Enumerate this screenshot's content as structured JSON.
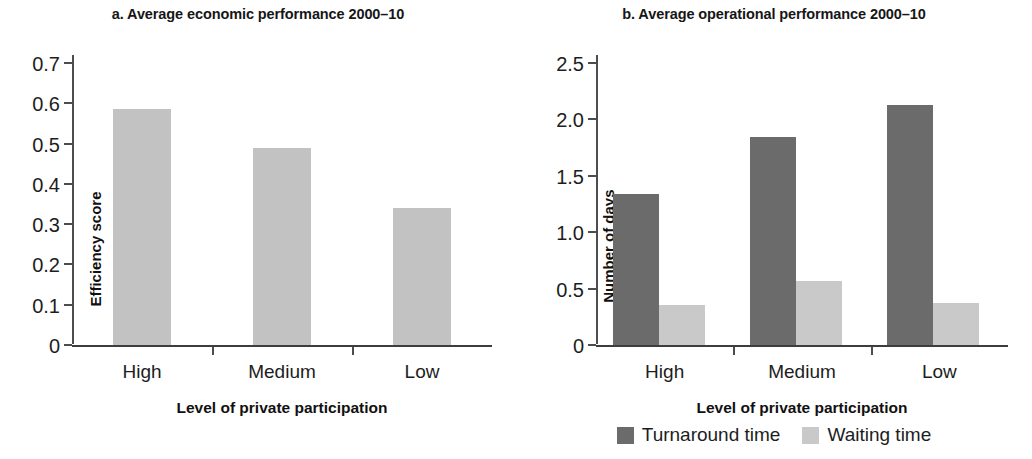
{
  "figure": {
    "panels": [
      {
        "id": "panel-a",
        "title": "a. Average economic performance 2000–10"
      },
      {
        "id": "panel-b",
        "title": "b. Average operational performance 2000–10"
      }
    ]
  },
  "legend": {
    "items": [
      {
        "label": "Turnaround time",
        "color": "#6b6b6b"
      },
      {
        "label": "Waiting time",
        "color": "#c9c9c9"
      }
    ]
  },
  "chart_data": [
    {
      "type": "bar",
      "title": "a. Average economic performance 2000–10",
      "xlabel": "Level of private participation",
      "ylabel": "Efficiency score",
      "categories": [
        "High",
        "Medium",
        "Low"
      ],
      "values": [
        0.585,
        0.49,
        0.34
      ],
      "ylim": [
        0,
        0.7
      ],
      "yticks": [
        0,
        0.1,
        0.2,
        0.3,
        0.4,
        0.5,
        0.6,
        0.7
      ],
      "ytick_labels": [
        "0",
        "0.1",
        "0.2",
        "0.3",
        "0.4",
        "0.5",
        "0.6",
        "0.7"
      ],
      "grid": false,
      "legend": "none",
      "bar_color": "#c2c2c2"
    },
    {
      "type": "bar",
      "title": "b. Average operational performance 2000–10",
      "xlabel": "Level of private participation",
      "ylabel": "Number of days",
      "categories": [
        "High",
        "Medium",
        "Low"
      ],
      "series": [
        {
          "name": "Turnaround time",
          "values": [
            1.34,
            1.845,
            2.13
          ],
          "color": "#6b6b6b"
        },
        {
          "name": "Waiting time",
          "values": [
            0.355,
            0.57,
            0.37
          ],
          "color": "#c9c9c9"
        }
      ],
      "ylim": [
        0,
        2.5
      ],
      "yticks": [
        0,
        0.5,
        1.0,
        1.5,
        2.0,
        2.5
      ],
      "ytick_labels": [
        "0",
        "0.5",
        "1.0",
        "1.5",
        "2.0",
        "2.5"
      ],
      "grid": false,
      "legend": "bottom-center"
    }
  ]
}
